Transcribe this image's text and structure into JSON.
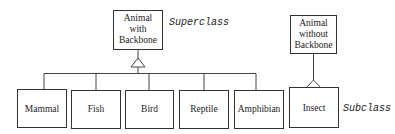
{
  "diagram": {
    "type": "class-inheritance",
    "superclasses": [
      {
        "id": "vertebrate",
        "lines": [
          "Animal",
          "with",
          "Backbone"
        ]
      },
      {
        "id": "invertebrate",
        "lines": [
          "Animal",
          "without",
          "Backbone"
        ]
      }
    ],
    "subclasses": [
      {
        "id": "mammal",
        "label": "Mammal",
        "parent": "vertebrate"
      },
      {
        "id": "fish",
        "label": "Fish",
        "parent": "vertebrate"
      },
      {
        "id": "bird",
        "label": "Bird",
        "parent": "vertebrate"
      },
      {
        "id": "reptile",
        "label": "Reptile",
        "parent": "vertebrate"
      },
      {
        "id": "amphibian",
        "label": "Amphibian",
        "parent": "vertebrate"
      },
      {
        "id": "insect",
        "label": "Insect",
        "parent": "invertebrate"
      }
    ],
    "annotations": {
      "superclass_label": "Superclass",
      "subclass_label": "Subclass"
    }
  }
}
